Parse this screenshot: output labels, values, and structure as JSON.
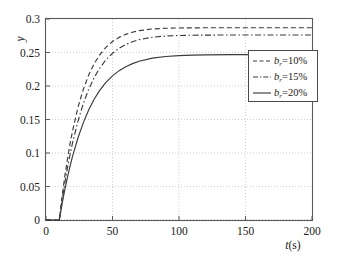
{
  "chart_data": {
    "type": "line",
    "title": "",
    "xlabel": "t(s)",
    "ylabel": "y",
    "xlim": [
      0,
      200
    ],
    "ylim": [
      0,
      0.3
    ],
    "grid": true,
    "legend_position": "right",
    "xticks": [
      "0",
      "50",
      "100",
      "150",
      "200"
    ],
    "xtick_values": [
      0,
      50,
      100,
      150,
      200
    ],
    "yticks": [
      "0",
      "0.05",
      "0.1",
      "0.15",
      "0.2",
      "0.25",
      "0.3"
    ],
    "ytick_values": [
      0,
      0.05,
      0.1,
      0.15,
      0.2,
      0.25,
      0.3
    ],
    "step_time": 10,
    "steady_state": 0.252,
    "series": [
      {
        "name": "b_r=10%",
        "label_prefix": "b",
        "label_subscript": "r",
        "label_suffix": "=10%",
        "style": "dashed",
        "time_constant": 14,
        "x": [
          0,
          2,
          4,
          6,
          8,
          10,
          12,
          14,
          16,
          18,
          20,
          24,
          28,
          32,
          36,
          40,
          45,
          50,
          55,
          60,
          65,
          70,
          80,
          90,
          100,
          110,
          120,
          140,
          160,
          180,
          200
        ],
        "y": [
          0,
          0,
          0,
          0,
          0,
          0,
          0.0336,
          0.0633,
          0.0896,
          0.1128,
          0.1333,
          0.1677,
          0.1947,
          0.2159,
          0.2325,
          0.2456,
          0.2576,
          0.2664,
          0.2726,
          0.2771,
          0.2803,
          0.2826,
          0.2851,
          0.2862,
          0.2866,
          0.2868,
          0.2869,
          0.2869,
          0.2869,
          0.2869,
          0.2869
        ]
      },
      {
        "name": "b_r=15%",
        "label_prefix": "b",
        "label_subscript": "r",
        "label_suffix": "=15%",
        "style": "dashdot",
        "time_constant": 17,
        "x": [
          0,
          2,
          4,
          6,
          8,
          10,
          12,
          14,
          16,
          18,
          20,
          24,
          28,
          32,
          36,
          40,
          45,
          50,
          55,
          60,
          65,
          70,
          80,
          90,
          100,
          110,
          120,
          140,
          160,
          180,
          200
        ],
        "y": [
          0,
          0,
          0,
          0,
          0,
          0,
          0.0282,
          0.0533,
          0.0763,
          0.097,
          0.1155,
          0.1473,
          0.1735,
          0.1946,
          0.2117,
          0.2257,
          0.239,
          0.2489,
          0.2564,
          0.262,
          0.2661,
          0.2692,
          0.2728,
          0.2746,
          0.2754,
          0.2758,
          0.276,
          0.2761,
          0.2761,
          0.2761,
          0.2761
        ]
      },
      {
        "name": "b_r=20%",
        "label_prefix": "b",
        "label_subscript": "r",
        "label_suffix": "=20%",
        "style": "solid",
        "time_constant": 21,
        "x": [
          0,
          2,
          4,
          6,
          8,
          10,
          12,
          14,
          16,
          18,
          20,
          24,
          28,
          32,
          36,
          40,
          45,
          50,
          55,
          60,
          65,
          70,
          80,
          90,
          100,
          110,
          120,
          140,
          160,
          180,
          200
        ],
        "y": [
          0,
          0,
          0,
          0,
          0,
          0,
          0.0229,
          0.0437,
          0.0626,
          0.0797,
          0.0953,
          0.1224,
          0.145,
          0.1638,
          0.1794,
          0.1924,
          0.2053,
          0.2152,
          0.2229,
          0.2288,
          0.2334,
          0.2369,
          0.2415,
          0.244,
          0.2454,
          0.2461,
          0.2465,
          0.2468,
          0.2469,
          0.2469,
          0.2469
        ]
      }
    ]
  },
  "axes": {
    "y_label": "y",
    "x_label_italic": "t",
    "x_label_rest": "(s)"
  },
  "legend": {
    "entries": [
      {
        "prefix": "b",
        "sub": "r",
        "rest": "=10%",
        "style": "dashed"
      },
      {
        "prefix": "b",
        "sub": "r",
        "rest": "=15%",
        "style": "dashdot"
      },
      {
        "prefix": "b",
        "sub": "r",
        "rest": "=20%",
        "style": "solid"
      }
    ]
  },
  "colors": {
    "curve": "#3a3a3a",
    "frame": "#5a5a5a",
    "grid": "#b9b9b9",
    "background": "#ffffff"
  }
}
